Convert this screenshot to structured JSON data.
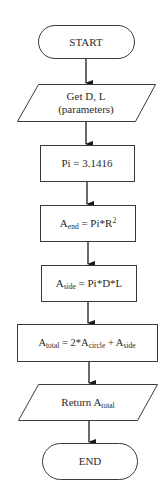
{
  "diagram": {
    "type": "flowchart",
    "colors": {
      "stroke": "#3a3a3a",
      "fill": "#ffffff",
      "text": "#2a2a2a"
    },
    "nodes": [
      {
        "id": "start",
        "shape": "terminal",
        "label": "START"
      },
      {
        "id": "input",
        "shape": "parallelogram",
        "line1": "Get D, L",
        "line2": "(parameters)"
      },
      {
        "id": "pi",
        "shape": "process",
        "label": "Pi = 3.1416"
      },
      {
        "id": "aend",
        "shape": "process",
        "base": "A",
        "sub": "end",
        "rest": " = Pi*R",
        "sup": "2"
      },
      {
        "id": "aside",
        "shape": "process",
        "base": "A",
        "sub": "side",
        "rest": " = Pi*D*L"
      },
      {
        "id": "atotal",
        "shape": "process",
        "base": "A",
        "sub": "total",
        "mid": " = 2*A",
        "sub2": "circle",
        "mid2": " + A",
        "sub3": "side"
      },
      {
        "id": "output",
        "shape": "parallelogram",
        "text": "Return A",
        "sub": "total"
      },
      {
        "id": "end",
        "shape": "terminal",
        "label": "END"
      }
    ],
    "edges": [
      [
        "start",
        "input"
      ],
      [
        "input",
        "pi"
      ],
      [
        "pi",
        "aend"
      ],
      [
        "aend",
        "aside"
      ],
      [
        "aside",
        "atotal"
      ],
      [
        "atotal",
        "output"
      ],
      [
        "output",
        "end"
      ]
    ]
  }
}
